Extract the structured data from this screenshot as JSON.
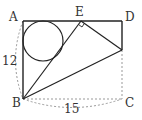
{
  "diagram": {
    "type": "geometry",
    "points": {
      "A": {
        "label": "A",
        "x": 23,
        "y": 21
      },
      "B": {
        "label": "B",
        "x": 23,
        "y": 99
      },
      "C": {
        "label": "C",
        "x": 122,
        "y": 99
      },
      "D": {
        "label": "D",
        "x": 122,
        "y": 21
      },
      "E": {
        "label": "E",
        "x": 81,
        "y": 21
      },
      "F": {
        "label": "",
        "x": 122,
        "y": 50
      }
    },
    "labels": {
      "A": "A",
      "B": "B",
      "C": "C",
      "D": "D",
      "E": "E",
      "side_AB": "12",
      "side_BC": "15"
    },
    "circle": {
      "cx": 43,
      "cy": 41,
      "r": 20
    },
    "right_angle_at": "E",
    "colors": {
      "stroke": "#222222",
      "dashed": "#999999",
      "text": "#333333"
    }
  }
}
